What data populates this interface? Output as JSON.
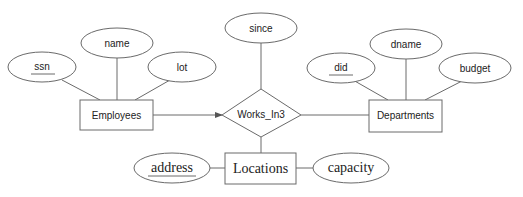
{
  "diagram": {
    "type": "ER diagram",
    "relationship": {
      "label": "Works_In3",
      "descriptive_attributes": [
        {
          "label": "since",
          "key": false
        }
      ]
    },
    "entities": [
      {
        "label": "Employees",
        "attributes": [
          {
            "label": "ssn",
            "key": true
          },
          {
            "label": "name",
            "key": false
          },
          {
            "label": "lot",
            "key": false
          }
        ],
        "participation": "key constraint (arrow to relationship)"
      },
      {
        "label": "Departments",
        "attributes": [
          {
            "label": "did",
            "key": true
          },
          {
            "label": "dname",
            "key": false
          },
          {
            "label": "budget",
            "key": false
          }
        ]
      },
      {
        "label": "Locations",
        "attributes": [
          {
            "label": "address",
            "key": true
          },
          {
            "label": "capacity",
            "key": false
          }
        ]
      }
    ]
  },
  "labels": {
    "ssn": "ssn",
    "name": "name",
    "lot": "lot",
    "employees": "Employees",
    "since": "since",
    "works_in3": "Works_In3",
    "did": "did",
    "dname": "dname",
    "budget": "budget",
    "departments": "Departments",
    "address": "address",
    "locations": "Locations",
    "capacity": "capacity"
  },
  "colors": {
    "stroke": "#6a6a6a",
    "text": "#222222",
    "background": "#ffffff"
  }
}
